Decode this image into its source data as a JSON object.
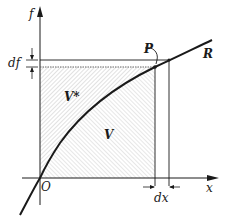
{
  "diagram": {
    "axes": {
      "y_label": "f",
      "x_label": "x",
      "origin_label": "O"
    },
    "labels": {
      "df": "df",
      "dx": "dx",
      "point": "P",
      "curve": "R",
      "region_upper": "V*",
      "region_lower": "V"
    },
    "colors": {
      "ink": "#1a1a1a",
      "hatch_upper": "#bdbdbd",
      "hatch_lower": "#c8c8c8",
      "background": "#ffffff"
    }
  }
}
